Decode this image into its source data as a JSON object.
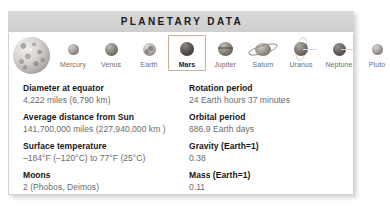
{
  "card": {
    "title": "PLANETARY DATA"
  },
  "hero": {
    "icon": "mars-large-sphere"
  },
  "planets": [
    {
      "name": "Mercury",
      "icon": "mercury-orb",
      "selected": false
    },
    {
      "name": "Venus",
      "icon": "venus-orb",
      "selected": false
    },
    {
      "name": "Earth",
      "icon": "earth-orb",
      "selected": false
    },
    {
      "name": "Mars",
      "icon": "mars-orb",
      "selected": true
    },
    {
      "name": "Jupiter",
      "icon": "jupiter-orb",
      "selected": false
    },
    {
      "name": "Saturn",
      "icon": "saturn-orb",
      "selected": false
    },
    {
      "name": "Uranus",
      "icon": "uranus-orb",
      "selected": false
    },
    {
      "name": "Neptune",
      "icon": "neptune-orb",
      "selected": false
    },
    {
      "name": "Pluto",
      "icon": "pluto-orb",
      "selected": false
    }
  ],
  "facts_left": [
    {
      "label": "Diameter at equator",
      "value": "4,222 miles (6,790 km)"
    },
    {
      "label": "Average distance from Sun",
      "value": "141,700,000 miles (227,940,000 km )"
    },
    {
      "label": "Surface temperature",
      "value": "–184°F (–120°C) to 77°F  (25°C)"
    },
    {
      "label": "Moons",
      "value": "2 (Phobos, Deimos)"
    }
  ],
  "facts_right": [
    {
      "label": "Rotation period",
      "value": "24 Earth hours 37 minutes"
    },
    {
      "label": "Orbital period",
      "value": "686.9 Earth days"
    },
    {
      "label": "Gravity (Earth=1)",
      "value": "0.38"
    },
    {
      "label": "Mass (Earth=1)",
      "value": "0.11"
    }
  ],
  "colors": {
    "title_bar": "#d4d4d4",
    "selection_border": "#c8b49a",
    "panel_border": "#d2d2d2",
    "label_text": "#161616",
    "value_text": "#6a6a6a"
  }
}
